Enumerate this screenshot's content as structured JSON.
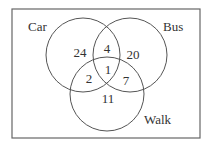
{
  "diagram": {
    "type": "venn",
    "universe": {
      "x": 12,
      "y": 9,
      "width": 188,
      "height": 129
    },
    "sets": [
      {
        "id": "car",
        "label": "Car",
        "cx": 83,
        "cy": 55,
        "r": 37,
        "label_x": 28,
        "label_y": 31
      },
      {
        "id": "bus",
        "label": "Bus",
        "cx": 130,
        "cy": 55,
        "r": 37,
        "label_x": 163,
        "label_y": 31
      },
      {
        "id": "walk",
        "label": "Walk",
        "cx": 107,
        "cy": 94,
        "r": 37,
        "label_x": 144,
        "label_y": 124
      }
    ],
    "regions": [
      {
        "id": "car_only",
        "sets": [
          "car"
        ],
        "value": "24",
        "x": 80,
        "y": 57
      },
      {
        "id": "car_bus",
        "sets": [
          "car",
          "bus"
        ],
        "value": "4",
        "x": 107,
        "y": 53
      },
      {
        "id": "bus_only",
        "sets": [
          "bus"
        ],
        "value": "20",
        "x": 133,
        "y": 59
      },
      {
        "id": "car_bus_walk",
        "sets": [
          "car",
          "bus",
          "walk"
        ],
        "value": "1",
        "x": 108,
        "y": 74
      },
      {
        "id": "car_walk",
        "sets": [
          "car",
          "walk"
        ],
        "value": "2",
        "x": 89,
        "y": 83
      },
      {
        "id": "bus_walk",
        "sets": [
          "bus",
          "walk"
        ],
        "value": "7",
        "x": 126,
        "y": 85
      },
      {
        "id": "walk_only",
        "sets": [
          "walk"
        ],
        "value": "11",
        "x": 108,
        "y": 103
      }
    ]
  }
}
